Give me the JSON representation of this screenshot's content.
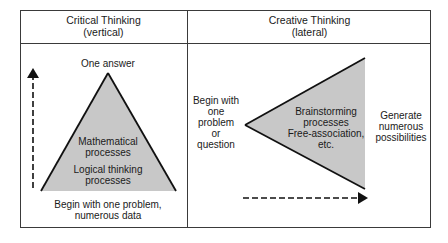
{
  "panels": {
    "left": {
      "title": "Critical Thinking",
      "subtitle": "(vertical)",
      "top_label": "One answer",
      "inner_label_1_line1": "Mathematical",
      "inner_label_1_line2": "processes",
      "inner_label_2_line1": "Logical thinking",
      "inner_label_2_line2": "processes",
      "bottom_label_line1": "Begin with one problem,",
      "bottom_label_line2": "numerous data",
      "shape": "upward-triangle",
      "arrow_direction": "up"
    },
    "right": {
      "title": "Creative Thinking",
      "subtitle": "(lateral)",
      "start_label_lines": [
        "Begin with",
        "one",
        "problem",
        "or",
        "question"
      ],
      "inner_label_lines": [
        "Brainstorming",
        "processes",
        "Free-association,",
        "etc."
      ],
      "end_label_lines": [
        "Generate",
        "numerous",
        "possibilities"
      ],
      "shape": "rightward-opening-triangle",
      "arrow_direction": "right"
    }
  },
  "colors": {
    "shape_fill": "#c8c8c8",
    "line": "#111111",
    "border": "#3a3a3a"
  }
}
